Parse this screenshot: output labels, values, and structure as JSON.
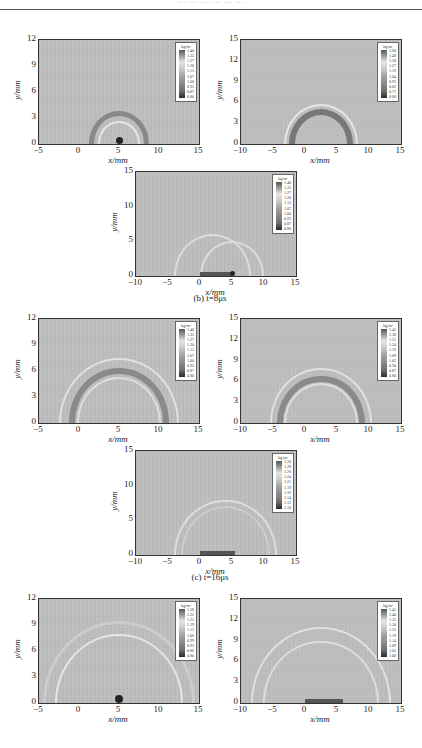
{
  "page": {
    "header_text": "··· ··· ··· ··· ··· ···"
  },
  "captions": {
    "b": "(b) t=8μs",
    "c": "(c) t=16μs"
  },
  "axis": {
    "xlabel": "x/mm",
    "ylabel": "y/mm"
  },
  "colorbar_unit": "kg/m³",
  "panels": [
    {
      "id": "a1",
      "xticks": [
        "−5",
        "0",
        "5",
        "10",
        "15"
      ],
      "yticks": [
        "12",
        "9",
        "6",
        "3",
        "0"
      ],
      "colorbar": [
        "1.40",
        "1.33",
        "1.27",
        "1.20",
        "1.13",
        "1.07",
        "1.00",
        "0.93",
        "0.87",
        "0.80"
      ]
    },
    {
      "id": "a2",
      "xticks": [
        "−10",
        "−5",
        "0",
        "5",
        "10",
        "15"
      ],
      "yticks": [
        "15",
        "12",
        "9",
        "6",
        "3",
        "0"
      ],
      "colorbar": [
        "1.60",
        "1.49",
        "1.38",
        "1.27",
        "1.16",
        "1.04",
        "0.93",
        "0.82",
        "0.71",
        "0.60"
      ]
    },
    {
      "id": "b3",
      "xticks": [
        "−10",
        "−5",
        "0",
        "5",
        "10",
        "15"
      ],
      "yticks": [
        "15",
        "10",
        "5",
        "0"
      ],
      "colorbar": [
        "1.40",
        "1.33",
        "1.27",
        "1.20",
        "1.13",
        "1.07",
        "1.00",
        "0.93",
        "0.87",
        "0.80"
      ]
    },
    {
      "id": "c1",
      "xticks": [
        "−5",
        "0",
        "5",
        "10",
        "15"
      ],
      "yticks": [
        "12",
        "9",
        "6",
        "3",
        "0"
      ],
      "colorbar": [
        "1.40",
        "1.33",
        "1.27",
        "1.20",
        "1.13",
        "1.07",
        "1.00",
        "0.93",
        "0.87",
        "0.80"
      ]
    },
    {
      "id": "c2",
      "xticks": [
        "−10",
        "−5",
        "0",
        "5",
        "10",
        "15"
      ],
      "yticks": [
        "15",
        "12",
        "9",
        "6",
        "3",
        "0"
      ],
      "colorbar": [
        "1.45",
        "1.38",
        "1.31",
        "1.24",
        "1.16",
        "1.09",
        "1.02",
        "0.94",
        "0.87",
        "0.80"
      ]
    },
    {
      "id": "c3",
      "xticks": [
        "−10",
        "−5",
        "0",
        "5",
        "10",
        "15"
      ],
      "yticks": [
        "15",
        "10",
        "5",
        "0"
      ],
      "colorbar": [
        "1.30",
        "1.28",
        "1.26",
        "1.24",
        "1.21",
        "1.19",
        "1.16",
        "1.14",
        "1.12",
        "1.10"
      ]
    },
    {
      "id": "d1",
      "xticks": [
        "−5",
        "0",
        "5",
        "10",
        "15"
      ],
      "yticks": [
        "12",
        "9",
        "6",
        "3",
        "0"
      ],
      "colorbar": [
        "1.38",
        "1.32",
        "1.25",
        "1.19",
        "1.12",
        "1.06",
        "0.99",
        "0.93",
        "0.86",
        "0.80"
      ]
    },
    {
      "id": "d2",
      "xticks": [
        "−10",
        "−5",
        "0",
        "5",
        "10",
        "15"
      ],
      "yticks": [
        "15",
        "12",
        "9",
        "6",
        "3",
        "0"
      ],
      "colorbar": [
        "1.45",
        "1.40",
        "1.35",
        "1.30",
        "1.25",
        "1.19",
        "1.14",
        "1.09",
        "1.05",
        "1.00"
      ]
    }
  ]
}
